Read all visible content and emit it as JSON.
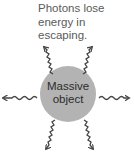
{
  "caption": {
    "lines": [
      "Photons lose",
      "energy in",
      "escaping."
    ]
  },
  "object": {
    "lines": [
      "Massive",
      "object"
    ],
    "fill_color": "#b3b3b3"
  },
  "photons": {
    "count": 6,
    "directions": [
      "upper-left",
      "upper-right",
      "left",
      "right",
      "lower-left",
      "lower-right"
    ],
    "color": "#444444"
  }
}
